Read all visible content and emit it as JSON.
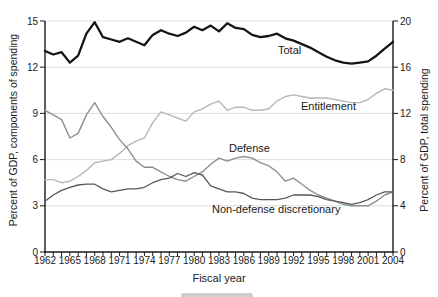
{
  "figure": {
    "x_axis_title": "Fiscal year",
    "background": "#ffffff",
    "axis_color": "#1a1a1a",
    "gridline_color": "#d9d9d9"
  },
  "chart_data": {
    "type": "line",
    "title": "",
    "xlabel": "Fiscal year",
    "x_range": [
      1962,
      2004
    ],
    "x": [
      1962,
      1963,
      1964,
      1965,
      1966,
      1967,
      1968,
      1969,
      1970,
      1971,
      1972,
      1973,
      1974,
      1975,
      1976,
      1977,
      1978,
      1979,
      1980,
      1981,
      1982,
      1983,
      1984,
      1985,
      1986,
      1987,
      1988,
      1989,
      1990,
      1991,
      1992,
      1993,
      1994,
      1995,
      1996,
      1997,
      1998,
      1999,
      2000,
      2001,
      2002,
      2003,
      2004
    ],
    "x_tick_labels": [
      "1962",
      "1965",
      "1968",
      "1971",
      "1974",
      "1977",
      "1980",
      "1983",
      "1986",
      "1989",
      "1992",
      "1995",
      "1998",
      "2001",
      "2004"
    ],
    "left_axis": {
      "title": "Percent of GDP, components of spending",
      "range": [
        0,
        15
      ],
      "ticks": [
        "0",
        "3",
        "6",
        "9",
        "12",
        "15"
      ]
    },
    "right_axis": {
      "title": "Percent of GDP, total spending",
      "range": [
        0,
        20
      ],
      "ticks": [
        "0",
        "4",
        "8",
        "12",
        "16",
        "20"
      ]
    },
    "grid": "horizontal gridlines at left-axis values 3,6,9,12,15",
    "legend_position": "inline-labels",
    "series": [
      {
        "id": "total",
        "name": "Total",
        "axis": "right",
        "color": "#141414",
        "stroke_width": 2.3,
        "values": [
          17.4,
          17.1,
          17.3,
          16.4,
          17.0,
          18.9,
          19.9,
          18.6,
          18.4,
          18.2,
          18.5,
          18.2,
          17.9,
          18.8,
          19.2,
          18.9,
          18.7,
          19.0,
          19.5,
          19.2,
          19.6,
          19.1,
          19.8,
          19.4,
          19.3,
          18.8,
          18.6,
          18.7,
          18.9,
          18.5,
          18.3,
          18.0,
          17.7,
          17.3,
          16.9,
          16.6,
          16.4,
          16.3,
          16.4,
          16.5,
          17.0,
          17.6,
          18.2
        ]
      },
      {
        "id": "entitlement",
        "name": "Entitlement",
        "axis": "left",
        "color": "#b4b8b6",
        "stroke_width": 1.4,
        "values": [
          4.7,
          4.7,
          4.5,
          4.6,
          4.9,
          5.3,
          5.8,
          5.9,
          6.0,
          6.4,
          6.9,
          7.2,
          7.4,
          8.4,
          9.1,
          8.9,
          8.7,
          8.5,
          9.1,
          9.3,
          9.6,
          9.8,
          9.2,
          9.4,
          9.4,
          9.2,
          9.2,
          9.3,
          9.8,
          10.1,
          10.2,
          10.1,
          10.0,
          10.0,
          10.0,
          9.9,
          9.8,
          9.7,
          9.7,
          9.9,
          10.3,
          10.6,
          10.5
        ]
      },
      {
        "id": "defense",
        "name": "Defense",
        "axis": "left",
        "color": "#8c9090",
        "stroke_width": 1.4,
        "values": [
          9.2,
          8.9,
          8.6,
          7.4,
          7.7,
          8.9,
          9.7,
          8.8,
          8.1,
          7.3,
          6.7,
          5.9,
          5.5,
          5.5,
          5.2,
          4.9,
          4.7,
          4.6,
          4.9,
          5.2,
          5.7,
          6.1,
          5.9,
          6.1,
          6.2,
          6.1,
          5.8,
          5.6,
          5.2,
          4.6,
          4.8,
          4.4,
          4.0,
          3.7,
          3.5,
          3.3,
          3.1,
          3.0,
          3.0,
          3.0,
          3.3,
          3.7,
          3.9
        ]
      },
      {
        "id": "nondefense",
        "name": "Non-defense discretionary",
        "axis": "left",
        "color": "#555a59",
        "stroke_width": 1.3,
        "values": [
          3.3,
          3.7,
          4.0,
          4.2,
          4.35,
          4.4,
          4.4,
          4.1,
          3.9,
          4.0,
          4.1,
          4.1,
          4.2,
          4.5,
          4.7,
          4.8,
          5.1,
          4.9,
          5.15,
          5.0,
          4.3,
          4.1,
          3.9,
          3.9,
          3.8,
          3.5,
          3.4,
          3.4,
          3.4,
          3.5,
          3.7,
          3.7,
          3.7,
          3.6,
          3.4,
          3.3,
          3.2,
          3.1,
          3.2,
          3.4,
          3.7,
          3.9,
          3.9
        ]
      }
    ],
    "annotations": [
      {
        "text": "Total",
        "x": 278,
        "y": 44
      },
      {
        "text": "Entitlement",
        "x": 301,
        "y": 100
      },
      {
        "text": "Defense",
        "x": 229,
        "y": 142
      },
      {
        "text": "Non-defense discretionary",
        "x": 212,
        "y": 203
      }
    ]
  }
}
